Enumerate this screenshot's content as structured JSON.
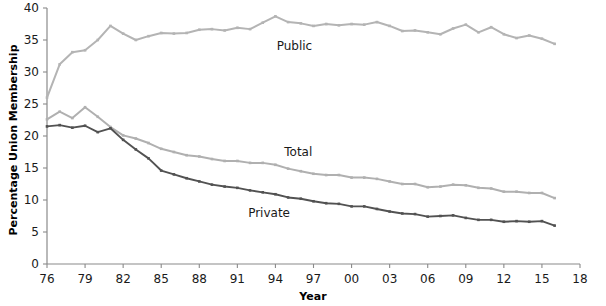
{
  "chart_data": {
    "type": "line",
    "title": "",
    "xlabel": "Year",
    "ylabel": "Percentage Union Membership",
    "xlim": [
      1976,
      2018
    ],
    "ylim": [
      0,
      40
    ],
    "ytick_values": [
      0,
      5,
      10,
      15,
      20,
      25,
      30,
      35,
      40
    ],
    "ytick_labels": [
      "0",
      "5",
      "10",
      "15",
      "20",
      "25",
      "30",
      "35",
      "40"
    ],
    "xtick_values": [
      1976,
      1979,
      1982,
      1985,
      1988,
      1991,
      1994,
      1997,
      2000,
      2003,
      2006,
      2009,
      2012,
      2015,
      2018
    ],
    "xtick_labels": [
      "76",
      "79",
      "82",
      "85",
      "88",
      "91",
      "94",
      "97",
      "00",
      "03",
      "06",
      "09",
      "12",
      "15",
      "18"
    ],
    "grid": false,
    "legend_position": "inline-annotations",
    "x": [
      1976,
      1977,
      1978,
      1979,
      1980,
      1981,
      1982,
      1983,
      1984,
      1985,
      1986,
      1987,
      1988,
      1989,
      1990,
      1991,
      1992,
      1993,
      1994,
      1995,
      1996,
      1997,
      1998,
      1999,
      2000,
      2001,
      2002,
      2003,
      2004,
      2005,
      2006,
      2007,
      2008,
      2009,
      2010,
      2011,
      2012,
      2013,
      2014,
      2015,
      2016
    ],
    "series": [
      {
        "name": "Public",
        "color": "#b4b4b4",
        "values": [
          26.0,
          31.2,
          33.1,
          33.4,
          35.0,
          37.2,
          36.0,
          35.0,
          35.6,
          36.1,
          36.0,
          36.1,
          36.6,
          36.7,
          36.5,
          36.9,
          36.7,
          37.7,
          38.7,
          37.8,
          37.6,
          37.2,
          37.5,
          37.3,
          37.5,
          37.4,
          37.8,
          37.2,
          36.4,
          36.5,
          36.2,
          35.9,
          36.8,
          37.4,
          36.2,
          37.0,
          35.9,
          35.3,
          35.7,
          35.2,
          34.4
        ]
      },
      {
        "name": "Total",
        "color": "#b0b0b0",
        "values": [
          22.6,
          23.8,
          22.8,
          24.5,
          23.0,
          21.4,
          20.1,
          19.6,
          18.9,
          18.0,
          17.5,
          17.0,
          16.8,
          16.4,
          16.1,
          16.1,
          15.8,
          15.8,
          15.5,
          14.9,
          14.5,
          14.1,
          13.9,
          13.9,
          13.5,
          13.5,
          13.3,
          12.9,
          12.5,
          12.5,
          12.0,
          12.1,
          12.4,
          12.3,
          11.9,
          11.8,
          11.3,
          11.3,
          11.1,
          11.1,
          10.3
        ]
      },
      {
        "name": "Private",
        "color": "#525252",
        "values": [
          21.5,
          21.7,
          21.3,
          21.6,
          20.6,
          21.2,
          19.4,
          17.9,
          16.5,
          14.6,
          14.0,
          13.4,
          12.9,
          12.4,
          12.1,
          11.9,
          11.5,
          11.2,
          10.9,
          10.4,
          10.2,
          9.8,
          9.5,
          9.4,
          9.0,
          9.0,
          8.6,
          8.2,
          7.9,
          7.8,
          7.4,
          7.5,
          7.6,
          7.2,
          6.9,
          6.9,
          6.6,
          6.7,
          6.6,
          6.7,
          6.0
        ]
      }
    ],
    "annotations": [
      {
        "text": "Public",
        "x": 1995.5,
        "y": 33.5
      },
      {
        "text": "Total",
        "x": 1995.8,
        "y": 16.9
      },
      {
        "text": "Private",
        "x": 1993.5,
        "y": 7.4
      }
    ]
  }
}
